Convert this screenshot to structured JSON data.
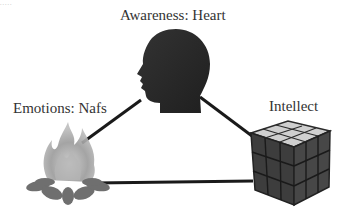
{
  "diagram": {
    "type": "triangle-of-concepts",
    "top_remnant": ".....",
    "nodes": [
      {
        "id": "heart",
        "label": "Awareness: Heart",
        "icon": "human-head-silhouette-icon",
        "position": "top"
      },
      {
        "id": "nafs",
        "label": "Emotions: Nafs",
        "icon": "campfire-icon",
        "position": "bottom-left"
      },
      {
        "id": "intellect",
        "label": "Intellect",
        "icon": "rubiks-cube-icon",
        "position": "bottom-right"
      }
    ],
    "edges": [
      {
        "from": "heart",
        "to": "nafs"
      },
      {
        "from": "heart",
        "to": "intellect"
      },
      {
        "from": "nafs",
        "to": "intellect"
      }
    ],
    "colors": {
      "line": "#1a1a1a",
      "head": "#2b2b2b",
      "cube_side": "#3a3a3a",
      "cube_top": "#d8d8d8",
      "fire": "#8a8a8a",
      "text": "#333333"
    }
  }
}
